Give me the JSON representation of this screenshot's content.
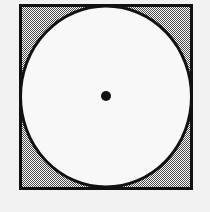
{
  "figure": {
    "title": "Circle inscribed in a square with marked center",
    "type": "geometric-diagram",
    "canvas": {
      "width": 210,
      "height": 212,
      "background_color": "#f2f2f2"
    },
    "shapes": {
      "square": {
        "name": "Square",
        "x": 19,
        "y": 4,
        "width": 174,
        "height": 186,
        "stroke_color": "#111111",
        "stroke_width": 3,
        "fill_color": "#9a9a9a",
        "fill_style": "dithered-halftone-gray"
      },
      "circle": {
        "name": "Inscribed circle",
        "center_x": 106,
        "center_y": 96,
        "radius_x": 87,
        "radius_y": 92,
        "stroke_color": "#111111",
        "stroke_width": 3,
        "fill_color": "#f8f8f8"
      },
      "center_dot": {
        "name": "Center point",
        "center_x": 106,
        "center_y": 96,
        "radius": 5,
        "fill_color": "#111111"
      }
    },
    "palette": {
      "ink": "#111111",
      "corner_gray": "#9a9a9a",
      "circle_fill": "#f8f8f8",
      "page_background": "#f2f2f2"
    }
  }
}
